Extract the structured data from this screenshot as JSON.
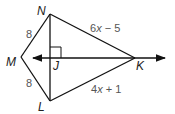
{
  "diagram": {
    "type": "kite",
    "vertices": {
      "N": {
        "label": "N",
        "x": 50,
        "y": 14
      },
      "M": {
        "label": "M",
        "x": 21,
        "y": 57
      },
      "L": {
        "label": "L",
        "x": 50,
        "y": 101
      },
      "K": {
        "label": "K",
        "x": 135,
        "y": 58
      },
      "J": {
        "label": "J",
        "x": 50,
        "y": 58
      }
    },
    "sides": {
      "MN": "8",
      "ML": "8",
      "NK_coef": "6",
      "NK_var": "x",
      "NK_rest": " − 5",
      "LK_coef": "4",
      "LK_var": "x",
      "LK_rest": " + 1"
    },
    "right_angle_at": "J",
    "line_color": "#111111",
    "label_color": "#222222",
    "measure_color": "#555555"
  }
}
